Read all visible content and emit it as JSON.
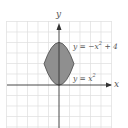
{
  "diagram": {
    "axes": {
      "x_label": "x",
      "y_label": "y"
    },
    "curves": [
      {
        "label": "y = −x² + 4",
        "equation": "-x^2+4"
      },
      {
        "label": "y = x²",
        "equation": "x^2"
      }
    ],
    "region": {
      "description": "area between y = x^2 and y = -x^2 + 4",
      "fill": "#8a8a8a",
      "stroke": "#555555"
    },
    "grid": {
      "x_min": -5,
      "x_max": 5,
      "y_min": -4,
      "y_max": 6
    },
    "colors": {
      "grid": "#dcdcdc",
      "axis": "#333333",
      "label": "#555555"
    }
  },
  "labels": {
    "x_axis": "x",
    "y_axis": "y",
    "top_curve_prefix": "y = −x",
    "top_curve_exp": "2",
    "top_curve_suffix": " + 4",
    "bottom_curve_prefix": "y = x",
    "bottom_curve_exp": "2"
  }
}
